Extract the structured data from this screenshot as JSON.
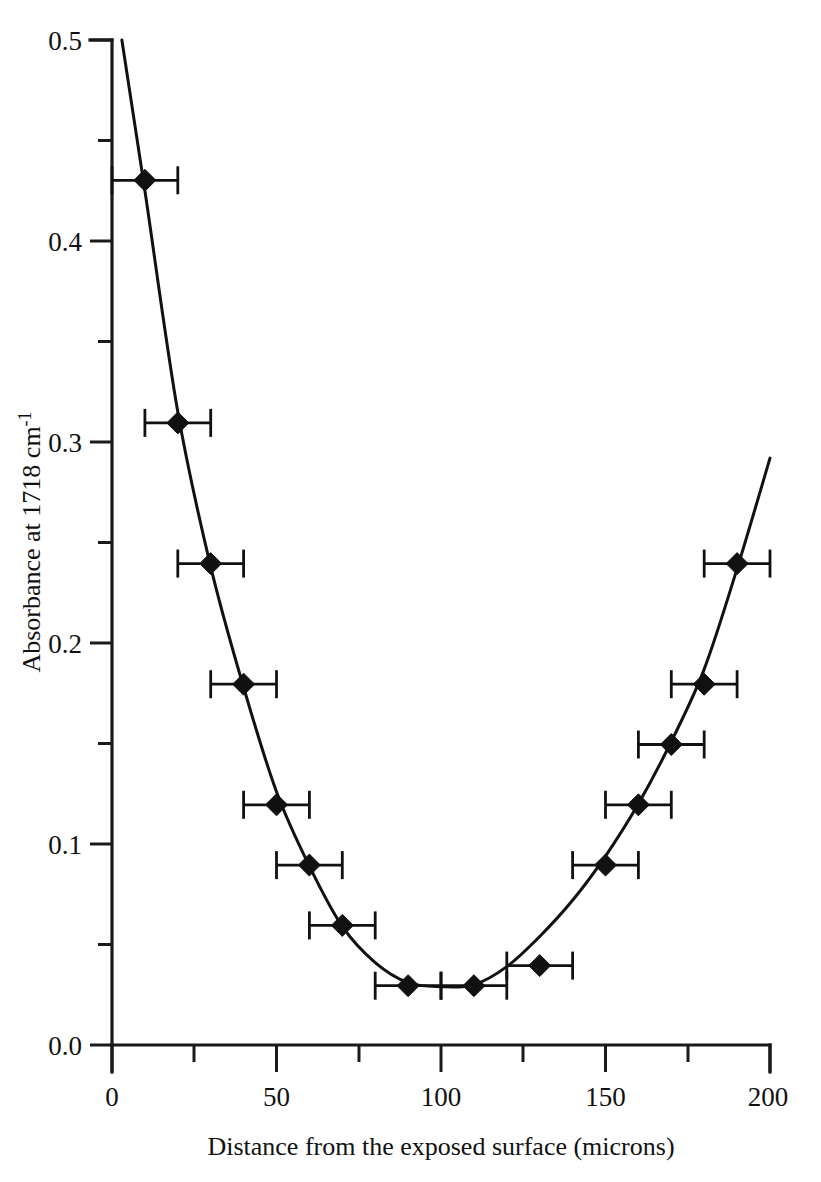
{
  "chart_data": {
    "type": "scatter",
    "title": "",
    "xlabel": "Distance from the exposed surface (microns)",
    "ylabel_main": "Absorbance at 1718 cm",
    "ylabel_sup": "-1",
    "ylabel_full": "Absorbance at 1718 cm-1",
    "xlim": [
      0,
      200
    ],
    "ylim": [
      0.0,
      0.5
    ],
    "grid": false,
    "legend": false,
    "x_ticks_major": [
      0,
      50,
      100,
      150,
      200
    ],
    "x_tick_labels": [
      "0",
      "50",
      "100",
      "150",
      "200"
    ],
    "x_ticks_minor": [
      25,
      75,
      125,
      175
    ],
    "y_ticks_major": [
      0.0,
      0.1,
      0.2,
      0.3,
      0.4,
      0.5
    ],
    "y_tick_labels": [
      "0.0",
      "0.1",
      "0.2",
      "0.3",
      "0.4",
      "0.5"
    ],
    "y_ticks_minor": [
      0.05,
      0.15,
      0.25,
      0.35,
      0.45
    ],
    "marker_shape": "diamond",
    "marker_color": "#111111",
    "curve_color": "#111111",
    "error_direction": "horizontal",
    "x_error": 10,
    "x": [
      10,
      20,
      30,
      40,
      50,
      60,
      70,
      90,
      110,
      130,
      150,
      160,
      170,
      180,
      190
    ],
    "y": [
      0.43,
      0.31,
      0.24,
      0.18,
      0.12,
      0.09,
      0.06,
      0.03,
      0.03,
      0.04,
      0.09,
      0.12,
      0.15,
      0.18,
      0.24
    ],
    "fit_curve": {
      "description": "smooth U-shaped fitted diffusion profile",
      "x": [
        3,
        10,
        20,
        30,
        40,
        50,
        60,
        70,
        80,
        90,
        100,
        110,
        120,
        130,
        140,
        150,
        160,
        170,
        180,
        190,
        200
      ],
      "y": [
        0.5,
        0.425,
        0.315,
        0.238,
        0.178,
        0.126,
        0.089,
        0.059,
        0.041,
        0.031,
        0.029,
        0.03,
        0.039,
        0.054,
        0.072,
        0.094,
        0.12,
        0.151,
        0.187,
        0.237,
        0.292
      ]
    }
  }
}
